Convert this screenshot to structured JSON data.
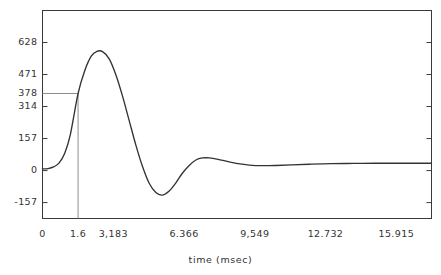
{
  "chart_data": {
    "type": "line",
    "title": "",
    "subtitle": "",
    "xlabel": "time (msec)",
    "ylabel": "",
    "xlim": [
      0,
      17.5
    ],
    "ylim": [
      -235,
      785
    ],
    "grid": false,
    "legend": null,
    "xticks": [
      {
        "value": 0,
        "label": "0"
      },
      {
        "value": 1.6,
        "label": "1.6"
      },
      {
        "value": 3.183,
        "label": "3,183"
      },
      {
        "value": 6.366,
        "label": "6.366"
      },
      {
        "value": 9.549,
        "label": "9,549"
      },
      {
        "value": 12.732,
        "label": "12.732"
      },
      {
        "value": 15.915,
        "label": "15.915"
      }
    ],
    "yticks": [
      {
        "value": 628,
        "label": "628"
      },
      {
        "value": 471,
        "label": "471"
      },
      {
        "value": 314,
        "label": "314"
      },
      {
        "value": 157,
        "label": "157"
      },
      {
        "value": 0,
        "label": "0"
      },
      {
        "value": -157,
        "label": "-157"
      }
    ],
    "annotations": [
      {
        "name": "reference-level",
        "type": "hline-segment",
        "y": 378,
        "label": "378",
        "x_from": 0,
        "x_to": 1.6
      },
      {
        "name": "rise-time-marker",
        "type": "vline-segment",
        "x": 1.6,
        "label": "1.6",
        "y_from": -235,
        "y_to": 378
      }
    ],
    "series": [
      {
        "name": "step-response",
        "color": "#333333",
        "x": [
          0.0,
          0.25,
          0.5,
          0.75,
          1.0,
          1.25,
          1.6,
          1.9,
          2.2,
          2.45,
          2.7,
          3.0,
          3.3,
          3.6,
          3.9,
          4.2,
          4.5,
          4.8,
          5.1,
          5.4,
          5.7,
          6.0,
          6.3,
          6.6,
          6.9,
          7.2,
          7.5,
          7.9,
          8.3,
          8.8,
          9.3,
          9.9,
          10.5,
          11.2,
          12.0,
          13.0,
          14.0,
          15.0,
          16.0,
          17.0,
          17.5
        ],
        "y": [
          8,
          10,
          18,
          38,
          85,
          175,
          378,
          490,
          562,
          585,
          583,
          548,
          470,
          365,
          245,
          125,
          20,
          -62,
          -108,
          -120,
          -100,
          -60,
          -12,
          25,
          52,
          62,
          62,
          55,
          45,
          34,
          27,
          24,
          25,
          28,
          31,
          34,
          35,
          36,
          36,
          36,
          36
        ]
      }
    ]
  },
  "axes": {
    "frame_color": "#3a3a3a",
    "annotation_color": "#8c8c8c"
  }
}
